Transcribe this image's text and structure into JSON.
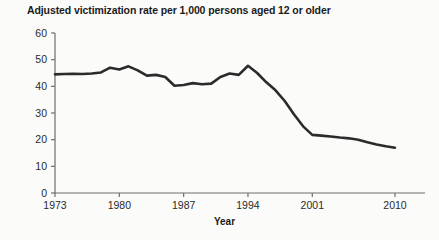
{
  "chart_data": {
    "type": "line",
    "title": "Adjusted victimization rate per 1,000 persons aged 12 or older",
    "xlabel": "Year",
    "ylabel": "",
    "xlim": [
      1973,
      2010
    ],
    "ylim": [
      0,
      60
    ],
    "grid": false,
    "legend": null,
    "x_ticks": [
      "1973",
      "1980",
      "1987",
      "1994",
      "2001",
      "2010"
    ],
    "x_tick_values": [
      1973,
      1980,
      1987,
      1994,
      2001,
      2010
    ],
    "y_ticks": [
      "0",
      "10",
      "20",
      "30",
      "40",
      "50",
      "60"
    ],
    "y_tick_values": [
      0,
      10,
      20,
      30,
      40,
      50,
      60
    ],
    "line_color": "#2b2b2b",
    "line_width": 2.6,
    "x": [
      1973,
      1974,
      1975,
      1976,
      1977,
      1978,
      1979,
      1980,
      1981,
      1982,
      1983,
      1984,
      1985,
      1986,
      1987,
      1988,
      1989,
      1990,
      1991,
      1992,
      1993,
      1994,
      1995,
      1996,
      1997,
      1998,
      1999,
      2000,
      2001,
      2002,
      2003,
      2004,
      2005,
      2006,
      2007,
      2008,
      2009,
      2010
    ],
    "values": [
      44.5,
      44.6,
      44.7,
      44.6,
      44.8,
      45.2,
      47.0,
      46.3,
      47.5,
      46.0,
      44.0,
      44.3,
      43.5,
      40.2,
      40.5,
      41.2,
      40.8,
      41.0,
      43.5,
      44.8,
      44.3,
      47.7,
      45.0,
      41.5,
      38.5,
      34.5,
      29.5,
      25.0,
      21.8,
      21.5,
      21.2,
      20.8,
      20.5,
      20.0,
      19.0,
      18.2,
      17.5,
      17.0
    ]
  }
}
